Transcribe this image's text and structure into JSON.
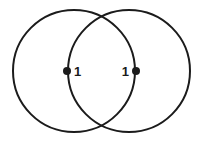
{
  "figure": {
    "background_color": "#ffffff",
    "stroke_color": "#1b1b1b",
    "stroke_width": 2,
    "dot_color": "#1b1b1b",
    "width": 203,
    "height": 145
  },
  "circles": [
    {
      "name": "left-circle",
      "cx": 74,
      "cy": 71,
      "r": 61
    },
    {
      "name": "right-circle",
      "cx": 129,
      "cy": 71,
      "r": 61
    }
  ],
  "points": [
    {
      "name": "left-point",
      "label": "1",
      "cx": 67,
      "cy": 71,
      "r": 4,
      "label_x": 74,
      "label_y": 76
    },
    {
      "name": "right-point",
      "label": "1",
      "cx": 136,
      "cy": 71,
      "r": 4,
      "label_x": 129,
      "label_y": 76
    }
  ]
}
